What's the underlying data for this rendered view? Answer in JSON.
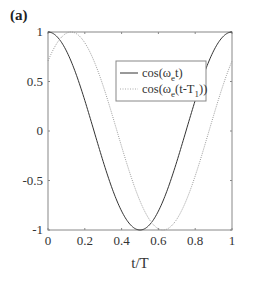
{
  "panel_label": "(a)",
  "chart_data": {
    "type": "line",
    "title": "",
    "xlabel": "t/T",
    "ylabel": "",
    "xlim": [
      0,
      1
    ],
    "ylim": [
      -1,
      1
    ],
    "grid": false,
    "x_ticks": [
      "0",
      "0.2",
      "0.4",
      "0.6",
      "0.8",
      "1"
    ],
    "y_ticks": [
      "1",
      "0.5",
      "0",
      "-0.5",
      "-1"
    ],
    "legend_position": "upper-right-inside",
    "series": [
      {
        "name": "cos(ω_e t)",
        "style": "solid",
        "color": "#333333",
        "formula": "cos(2*pi*t)",
        "x": [
          0,
          0.125,
          0.25,
          0.375,
          0.5,
          0.625,
          0.75,
          0.875,
          1
        ],
        "values": [
          1,
          0.71,
          0,
          -0.71,
          -1,
          -0.71,
          0,
          0.71,
          1
        ]
      },
      {
        "name": "cos(ω_e(t-T_1))",
        "style": "dotted",
        "color": "#999999",
        "formula": "cos(2*pi*(t-0.125))",
        "x": [
          0,
          0.125,
          0.25,
          0.375,
          0.5,
          0.625,
          0.75,
          0.875,
          1
        ],
        "values": [
          0.71,
          1,
          0.71,
          0,
          -0.71,
          -1,
          -0.71,
          0,
          0.71
        ]
      }
    ]
  },
  "legend": {
    "entry1": {
      "base": "cos(ω",
      "sub": "e",
      "tail": "t)"
    },
    "entry2": {
      "base": "cos(ω",
      "sub": "e",
      "mid": "(t-T",
      "sub2": "1",
      "tail": "))"
    }
  }
}
